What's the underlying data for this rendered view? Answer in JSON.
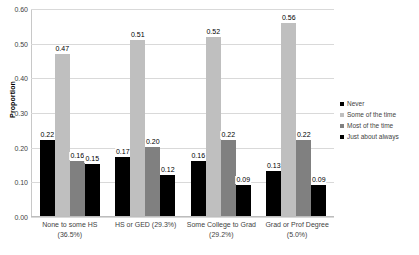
{
  "chart_data": {
    "type": "bar",
    "title": "",
    "xlabel": "",
    "ylabel": "Proportion",
    "ylim": [
      0.0,
      0.6
    ],
    "ytick_labels": [
      "0.60",
      "0.50",
      "0.40",
      "0.30",
      "0.20",
      "0.10",
      "0.00"
    ],
    "ytick_values": [
      0.6,
      0.5,
      0.4,
      0.3,
      0.2,
      0.1,
      0.0
    ],
    "grid": true,
    "legend_position": "right",
    "categories": [
      "None to some HS (36.5%)",
      "HS or GED (29.3%)",
      "Some College to Grad (29.2%)",
      "Grad or Prof Degree (5.0%)"
    ],
    "category_lines": [
      [
        "None to some HS",
        "(36.5%)"
      ],
      [
        "HS or GED (29.3%)",
        ""
      ],
      [
        "Some College to Grad",
        "(29.2%)"
      ],
      [
        "Grad or Prof Degree",
        "(5.0%)"
      ]
    ],
    "series": [
      {
        "name": "Never",
        "color": "#000000",
        "values": [
          0.22,
          0.17,
          0.16,
          0.13
        ],
        "labels": [
          "0.22",
          "0.17",
          "0.16",
          "0.13"
        ]
      },
      {
        "name": "Some of the time",
        "color": "#bfbfbf",
        "values": [
          0.47,
          0.51,
          0.52,
          0.56
        ],
        "labels": [
          "0.47",
          "0.51",
          "0.52",
          "0.56"
        ]
      },
      {
        "name": "Most of the time",
        "color": "#808080",
        "values": [
          0.16,
          0.2,
          0.22,
          0.22
        ],
        "labels": [
          "0.16",
          "0.20",
          "0.22",
          "0.22"
        ]
      },
      {
        "name": "Just about always",
        "color": "#000000",
        "values": [
          0.15,
          0.12,
          0.09,
          0.09
        ],
        "labels": [
          "0.15",
          "0.12",
          "0.09",
          "0.09"
        ]
      }
    ]
  }
}
